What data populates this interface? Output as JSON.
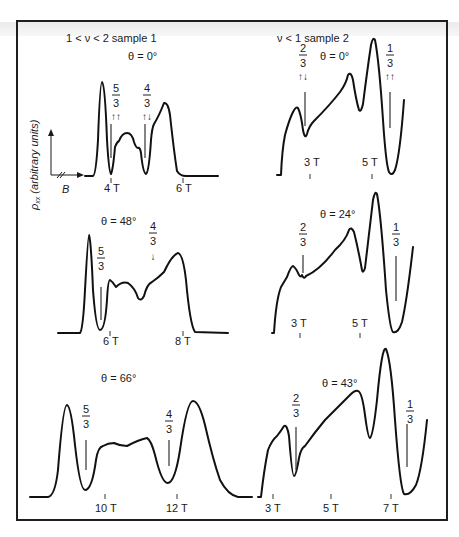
{
  "figure": {
    "frame": {
      "x": 16,
      "y": 20,
      "w": 430,
      "h": 499
    },
    "ylabel": "ρxx (arbitrary units)",
    "ylabel_main": "ρ",
    "ylabel_sub": "xx",
    "ylabel_rest": " (arbitrary units)",
    "xaxis_label": "B",
    "column_titles": [
      {
        "text": "1 < ν < 2  sample 1",
        "x": 66,
        "y": 42
      },
      {
        "text": "ν < 1   sample 2",
        "x": 277,
        "y": 42
      }
    ]
  },
  "chart_data": [
    {
      "type": "line",
      "title": "θ = 0°",
      "sample": "sample 1",
      "filling_range": "1 < ν < 2",
      "xlabel": "B",
      "ylabel": "ρxx (arbitrary units)",
      "tick_labels": [
        "4 T",
        "6 T"
      ],
      "annotations": [
        {
          "fraction": "5/3",
          "spin": "↑↑"
        },
        {
          "fraction": "4/3",
          "spin": "↑↓"
        }
      ],
      "title_pos": [
        128,
        60
      ],
      "ticks": [
        {
          "x": 111,
          "y": 178,
          "label": "4 T",
          "lx": 104,
          "ly": 192
        },
        {
          "x": 183,
          "y": 178,
          "label": "6 T",
          "lx": 176,
          "ly": 192
        }
      ],
      "fracs": [
        {
          "num": "5",
          "den": "3",
          "x": 116,
          "y": 92,
          "spin": "↑↑",
          "line": [
            111,
            124,
            111,
            158
          ]
        },
        {
          "num": "4",
          "den": "3",
          "x": 147,
          "y": 92,
          "spin": "↑↓",
          "line": [
            145,
            124,
            145,
            158
          ]
        }
      ],
      "path": "M85,176 L93,176 Q96,175 98,140 Q100,82 102,82 Q105,84 107,140 Q109,173 111,174 Q113,170 115,147 Q117,142 119,141 Q122,133 127,133 Q132,133 134,142 Q136,148 138,148 Q140,147 141,153 Q143,173 146,174 Q149,172 151,140 Q152,128 154,124 Q159,116 164,103 Q168,102 170,115 Q174,152 177,171 Q180,176 186,176 L218,176"
    },
    {
      "type": "line",
      "title": "θ = 0°",
      "sample": "sample 2",
      "filling_range": "ν < 1",
      "tick_labels": [
        "3 T",
        "5 T"
      ],
      "annotations": [
        {
          "fraction": "2/3",
          "spin": "↑↓"
        },
        {
          "fraction": "1/3",
          "spin": "↑↑"
        }
      ],
      "title_pos": [
        320,
        60
      ],
      "ticks": [
        {
          "x": 310,
          "y": 174,
          "label": "3 T",
          "lx": 304,
          "ly": 166
        },
        {
          "x": 372,
          "y": 174,
          "label": "5 T",
          "lx": 362,
          "ly": 166
        }
      ],
      "fracs": [
        {
          "num": "2",
          "den": "3",
          "x": 303,
          "y": 52,
          "spin": "↑↓",
          "line": [
            305,
            92,
            305,
            126
          ]
        },
        {
          "num": "1",
          "den": "3",
          "x": 390,
          "y": 52,
          "spin": "↑↑",
          "line": [
            390,
            92,
            390,
            128
          ]
        }
      ],
      "path": "M277,175 L281,175 Q282,150 285,135 Q289,120 293,112 Q296,106 298,108 Q301,114 303,130 Q305,140 307,134 Q309,126 314,121 Q330,105 340,92 Q346,84 348,75 Q351,71 353,80 Q356,100 359,110 Q361,113 363,104 Q367,72 371,45 Q373,36 375,40 Q379,60 383,120 Q386,165 389,172 Q392,177 395,170 Q400,155 404,100"
    },
    {
      "type": "line",
      "title": "θ = 48°",
      "sample": "sample 1",
      "tick_labels": [
        "6 T",
        "8 T"
      ],
      "annotations": [
        {
          "fraction": "5/3",
          "spin": ""
        },
        {
          "fraction": "4/3",
          "spin": "↓"
        }
      ],
      "title_pos": [
        101,
        225
      ],
      "ticks": [
        {
          "x": 110,
          "y": 331,
          "label": "6 T",
          "lx": 103,
          "ly": 345
        },
        {
          "x": 183,
          "y": 331,
          "label": "8 T",
          "lx": 175,
          "ly": 345
        }
      ],
      "fracs": [
        {
          "num": "5",
          "den": "3",
          "x": 101,
          "y": 255,
          "spin": "",
          "line": [
            101,
            287,
            101,
            320
          ]
        },
        {
          "num": "4",
          "den": "3",
          "x": 153,
          "y": 230,
          "spin": "↓",
          "line": null
        }
      ],
      "path": "M58,333 L80,333 Q83,330 85,290 Q88,235 89,235 Q91,240 93,290 Q96,330 100,330 Q105,330 107,300 Q108,280 110,280 Q113,282 116,287 Q122,281 128,283 Q135,288 138,298 Q141,302 144,296 Q147,284 152,282 Q158,278 164,272 Q172,255 178,253 Q183,254 186,280 Q190,325 195,332 L228,333"
    },
    {
      "type": "line",
      "title": "θ = 24°",
      "sample": "sample 2",
      "tick_labels": [
        "3 T",
        "5 T"
      ],
      "annotations": [
        {
          "fraction": "2/3",
          "spin": ""
        },
        {
          "fraction": "1/3",
          "spin": ""
        }
      ],
      "title_pos": [
        320,
        218
      ],
      "ticks": [
        {
          "x": 300,
          "y": 333,
          "label": "3 T",
          "lx": 291,
          "ly": 327
        },
        {
          "x": 360,
          "y": 333,
          "label": "5 T",
          "lx": 352,
          "ly": 327
        }
      ],
      "fracs": [
        {
          "num": "2",
          "den": "3",
          "x": 303,
          "y": 231,
          "spin": "",
          "line": [
            303,
            255,
            303,
            273
          ]
        },
        {
          "num": "1",
          "den": "3",
          "x": 396,
          "y": 231,
          "spin": "",
          "line": [
            396,
            256,
            396,
            301
          ]
        }
      ],
      "path": "M272,333 L274,333 Q276,300 281,287 Q284,282 287,277 Q291,266 293,266 Q296,268 299,275 Q301,278 302,275 Q304,280 306,276 Q320,270 335,250 Q346,240 349,230 Q351,226 354,232 Q358,248 362,270 Q363,274 365,268 Q370,225 373,200 Q375,190 377,194 Q381,215 386,290 Q390,330 393,332 Q398,334 402,322 Q407,300 413,247"
    },
    {
      "type": "line",
      "title": "θ = 66°",
      "sample": "sample 1",
      "tick_labels": [
        "10 T",
        "12 T"
      ],
      "annotations": [
        {
          "fraction": "5/3",
          "spin": ""
        },
        {
          "fraction": "4/3",
          "spin": ""
        }
      ],
      "title_pos": [
        101,
        382
      ],
      "ticks": [
        {
          "x": 105,
          "y": 494,
          "label": "10 T",
          "lx": 95,
          "ly": 512
        },
        {
          "x": 177,
          "y": 494,
          "label": "12 T",
          "lx": 166,
          "ly": 512
        }
      ],
      "fracs": [
        {
          "num": "5",
          "den": "3",
          "x": 86,
          "y": 413,
          "spin": "",
          "line": [
            86,
            440,
            86,
            470
          ]
        },
        {
          "num": "4",
          "den": "3",
          "x": 169,
          "y": 418,
          "spin": "",
          "line": [
            169,
            440,
            169,
            466
          ]
        }
      ],
      "path": "M30,497 L48,497 Q55,496 58,470 Q63,405 67,405 Q71,406 75,445 Q80,490 85,490 Q92,490 96,460 Q98,447 103,446 Q108,443 114,443 Q120,446 127,446 Q138,440 147,438 Q151,440 155,455 Q162,484 168,483 Q175,482 180,450 Q187,401 193,401 Q199,401 205,425 Q213,460 220,480 Q228,495 238,497 L252,497"
    },
    {
      "type": "line",
      "title": "θ = 43°",
      "sample": "sample 2",
      "tick_labels": [
        "3 T",
        "5 T",
        "7 T"
      ],
      "annotations": [
        {
          "fraction": "2/3",
          "spin": ""
        },
        {
          "fraction": "1/3",
          "spin": ""
        }
      ],
      "title_pos": [
        322,
        387
      ],
      "ticks": [
        {
          "x": 273,
          "y": 494,
          "label": "3 T",
          "lx": 265,
          "ly": 512
        },
        {
          "x": 331,
          "y": 494,
          "label": "5 T",
          "lx": 323,
          "ly": 512
        },
        {
          "x": 391,
          "y": 494,
          "label": "7 T",
          "lx": 383,
          "ly": 512
        }
      ],
      "fracs": [
        {
          "num": "2",
          "den": "3",
          "x": 296,
          "y": 402,
          "spin": "",
          "line": [
            296,
            427,
            296,
            470
          ]
        },
        {
          "num": "1",
          "den": "3",
          "x": 410,
          "y": 408,
          "spin": "",
          "line": [
            407,
            424,
            407,
            467
          ]
        }
      ],
      "path": "M258,497 L261,497 Q264,470 268,450 Q272,440 277,436 Q281,431 284,426 Q287,424 289,436 Q292,476 294,476 Q296,476 299,458 Q301,448 305,446 Q315,432 325,420 Q340,405 350,395 Q355,390 358,391 Q362,392 365,415 Q368,438 370,438 Q373,436 377,400 Q382,345 386,349 Q391,360 395,420 Q400,488 404,494 Q410,496 416,485 Q422,470 427,420"
    }
  ]
}
